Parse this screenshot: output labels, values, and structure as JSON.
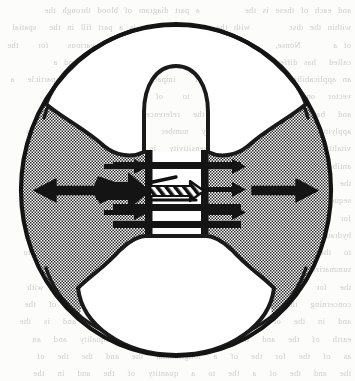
{
  "figure": {
    "background_bleed_text": "a scanned book page with faint show-through text from the reverse side, illegible",
    "colors": {
      "ink": "#1a1a1a",
      "stipple_gray": "#9a9a9a",
      "paper": "#fcfcfb",
      "void_white": "#ffffff",
      "bleed_text": "#c9c6c2"
    },
    "geometry": {
      "circle_center_x": 176,
      "circle_center_y": 190,
      "circle_radius_x": 157,
      "circle_radius_y": 168,
      "outline_width_px": 4
    }
  },
  "elements": {
    "outer_circle_label": "outer circle boundary",
    "stippled_body_label": "stippled annular body",
    "upper_void_label": "upper white lens void",
    "lower_void_label": "lower white lens void",
    "channel_label": "central channel",
    "channel_bars_label": "horizontal channel bars"
  },
  "arrows": [
    {
      "id": "outer-left",
      "name": "outer-left-arrow",
      "direction": "left",
      "size": "large",
      "x": 36,
      "y": 190,
      "length": 62,
      "description": "large solid arrow at left pointing outward (left)"
    },
    {
      "id": "outer-right",
      "name": "outer-right-arrow",
      "direction": "right",
      "size": "large",
      "x": 258,
      "y": 190,
      "length": 62,
      "description": "large solid arrow at right pointing outward (right)"
    },
    {
      "id": "inner-left-mid",
      "name": "inner-left-mid-arrow",
      "direction": "right",
      "size": "medium",
      "x": 100,
      "y": 190,
      "length": 48,
      "description": "thick arrow left of channel pointing right into channel"
    },
    {
      "id": "inner-left-top",
      "name": "inner-left-top-arrow",
      "direction": "right",
      "size": "small",
      "x": 108,
      "y": 168,
      "length": 42,
      "description": "small arrow pointing right into channel, upper"
    },
    {
      "id": "inner-left-bottom",
      "name": "inner-left-bottom-arrow",
      "direction": "right",
      "size": "small",
      "x": 108,
      "y": 213,
      "length": 42,
      "description": "small arrow pointing right into channel, lower"
    },
    {
      "id": "inner-right-top",
      "name": "inner-right-top-arrow",
      "direction": "right",
      "size": "small",
      "x": 204,
      "y": 168,
      "length": 42,
      "description": "small arrow pointing right out of channel, upper"
    },
    {
      "id": "inner-right-mid",
      "name": "inner-right-mid-arrow",
      "direction": "right",
      "size": "small",
      "x": 204,
      "y": 190,
      "length": 42,
      "description": "small arrow pointing right out of channel, middle"
    },
    {
      "id": "inner-right-bottom",
      "name": "inner-right-bottom-arrow",
      "direction": "right",
      "size": "small",
      "x": 204,
      "y": 213,
      "length": 42,
      "description": "small arrow pointing right out of channel, lower"
    },
    {
      "id": "channel-hatched",
      "name": "channel-hatched-arrow",
      "direction": "right",
      "size": "hatched",
      "x": 152,
      "y": 192,
      "length": 54,
      "description": "hatched/striped arrow inside the central channel pointing right"
    }
  ],
  "channel": {
    "left_wall_x": 148,
    "right_wall_x": 206,
    "top_y": 150,
    "bottom_y": 233,
    "bars": [
      {
        "name": "channel-bar-top",
        "y": 163
      },
      {
        "name": "channel-bar-middle",
        "y": 207
      },
      {
        "name": "channel-bar-bottom",
        "y": 224
      }
    ]
  }
}
